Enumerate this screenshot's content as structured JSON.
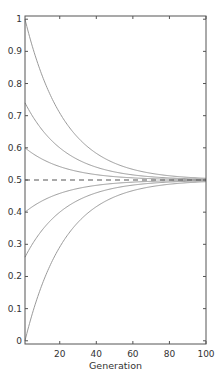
{
  "chart_data": {
    "type": "line",
    "title": "",
    "xlabel": "Generation",
    "ylabel": "",
    "xlim": [
      1,
      100
    ],
    "ylim": [
      -0.01,
      1.01
    ],
    "grid": false,
    "legend": null,
    "x_ticks": [
      20,
      40,
      60,
      80,
      100
    ],
    "y_ticks": [
      0,
      0.1,
      0.2,
      0.3,
      0.4,
      0.5,
      0.6,
      0.7,
      0.8,
      0.9,
      1
    ],
    "y_tick_labels": [
      "0",
      "0.1",
      "0.2",
      "0.3",
      "0.4",
      "0.5",
      "0.6",
      "0.7",
      "0.8",
      "0.9",
      "1"
    ],
    "model": "p(n) = 0.5 + (p0 - 0.5) * 0.955^(n-1)",
    "decay_per_generation": 0.955,
    "series": [
      {
        "name": "start 1.0",
        "start": 1.0,
        "color": "#9a9a9a"
      },
      {
        "name": "start 0.75",
        "start": 0.74,
        "color": "#9a9a9a"
      },
      {
        "name": "start 0.6",
        "start": 0.6,
        "color": "#9a9a9a"
      },
      {
        "name": "start 0.4",
        "start": 0.4,
        "color": "#9a9a9a"
      },
      {
        "name": "start 0.25",
        "start": 0.26,
        "color": "#9a9a9a"
      },
      {
        "name": "start 0.0",
        "start": 0.0,
        "color": "#9a9a9a"
      }
    ],
    "sample_values": {
      "generation": [
        1,
        20,
        40,
        60,
        80,
        100
      ],
      "start_1.0": [
        1.0,
        0.708,
        0.588,
        0.535,
        0.516,
        0.507
      ],
      "start_0.75": [
        0.74,
        0.615,
        0.542,
        0.517,
        0.507,
        0.503
      ],
      "start_0.6": [
        0.6,
        0.542,
        0.518,
        0.507,
        0.503,
        0.501
      ],
      "start_0.4": [
        0.4,
        0.458,
        0.482,
        0.493,
        0.497,
        0.499
      ],
      "start_0.25": [
        0.26,
        0.385,
        0.458,
        0.483,
        0.493,
        0.497
      ],
      "start_0.0": [
        0.0,
        0.292,
        0.412,
        0.465,
        0.484,
        0.493
      ]
    },
    "reference_line": {
      "y": 0.5,
      "style": "dashed",
      "color": "#555555"
    }
  }
}
